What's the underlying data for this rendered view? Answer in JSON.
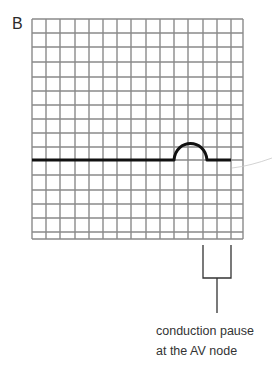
{
  "figure": {
    "panel_label": "B",
    "grid": {
      "x_lines": [
        32,
        46,
        60,
        75,
        89,
        103,
        117,
        131,
        146,
        160,
        174,
        188,
        203,
        217,
        231,
        243
      ],
      "y_lines": [
        19,
        33,
        47,
        62,
        77,
        91,
        105,
        119,
        133,
        147,
        160,
        175,
        190,
        204,
        218,
        232,
        239
      ],
      "line_color": "#8a8a8a"
    },
    "trace": {
      "description": "ECG baseline with P wave followed by flat segment",
      "color": "#111111",
      "baseline_y": 160,
      "start_x": 32,
      "p_wave_start_x": 174,
      "p_wave_peak_x": 190,
      "p_wave_peak_y": 143,
      "p_wave_end_x": 207,
      "end_x": 231
    },
    "bracket": {
      "left_x": 203,
      "right_x": 231,
      "top_y": 245,
      "bottom_y": 278,
      "stem_x": 217,
      "stem_end_y": 313
    },
    "annotation": {
      "line1": "conduction pause",
      "line2": "at the AV node"
    }
  }
}
